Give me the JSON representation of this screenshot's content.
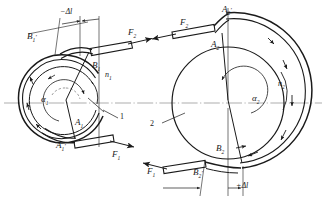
{
  "figure": {
    "type": "engineering-diagram",
    "background_color": "#ffffff",
    "line_color": "#1a1a1a",
    "axis_color": "#777777"
  },
  "left_assembly": {
    "id": "1",
    "callout_label": "1",
    "center": {
      "x": 66,
      "y": 103
    },
    "outer_radius": 44,
    "inner_radius": 34,
    "labels": {
      "delta_l": "−Δl",
      "B_prime": "B",
      "B_prime_sub": "1",
      "B_plain": "B",
      "B_plain_sub": "1",
      "A_plain": "A",
      "A_plain_sub": "1",
      "A_prime": "A",
      "A_prime_sub": "1",
      "alpha": "α",
      "alpha_sub": "1",
      "n": "n",
      "n_sub": "1",
      "force_top": "F",
      "force_top_sub": "2",
      "force_bottom": "F",
      "force_bottom_sub": "1"
    }
  },
  "right_assembly": {
    "id": "2",
    "callout_label": "2",
    "center": {
      "x": 228,
      "y": 103
    },
    "outer_radius": 66,
    "inner_radius": 56,
    "labels": {
      "delta_l": "+Δl",
      "A_prime": "A",
      "A_prime_sub": "2",
      "A_plain": "A",
      "A_plain_sub": "2",
      "B_plain": "B",
      "B_plain_sub": "2",
      "B_prime": "B",
      "B_prime_sub": "2",
      "alpha": "α",
      "alpha_sub": "2",
      "n": "n",
      "n_sub": "2",
      "force_top": "F",
      "force_top_sub": "2",
      "force_bottom": "F",
      "force_bottom_sub": "1"
    }
  }
}
